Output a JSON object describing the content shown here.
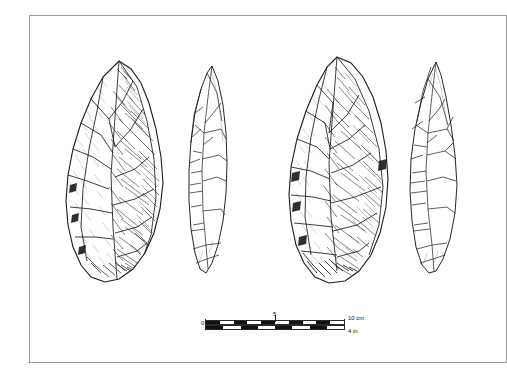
{
  "plate": {
    "kind": "archaeological-line-drawing",
    "subject": "bifacial stone handaxe",
    "background_color": "#ffffff",
    "frame_color": "#9a9a9e",
    "ink_color": "#1a1a1a"
  },
  "figures": [
    {
      "id": "handaxe-obverse",
      "label": "",
      "view": "obverse face",
      "technique": "stipple and hatch shading"
    },
    {
      "id": "handaxe-profile-left",
      "label": "",
      "view": "lateral profile",
      "technique": "outline with flake scars"
    },
    {
      "id": "handaxe-reverse",
      "label": "",
      "view": "reverse face",
      "technique": "stipple and hatch shading"
    },
    {
      "id": "handaxe-profile-right",
      "label": "",
      "view": "lateral profile",
      "technique": "outline with flake scars"
    }
  ],
  "scale_bar": {
    "zero_label": "0",
    "mid_label": "5",
    "cm_label": "10 cm",
    "in_label": "4 in",
    "cm_segments": 10,
    "in_segments": 8,
    "bar_color_dark": "#111111",
    "bar_color_light": "#ffffff"
  }
}
